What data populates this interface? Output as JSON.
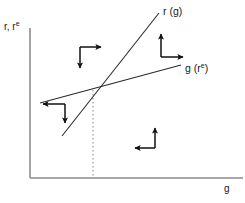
{
  "figure": {
    "type": "phase-diagram",
    "width": 245,
    "height": 203,
    "background": "#ffffff",
    "axis_color": "#8c8c8c",
    "curve_color": "#2b2b2b",
    "arrow_color": "#111111",
    "dotted_color": "#9a9a9a"
  },
  "axes": {
    "y_label": "r, r",
    "y_label_sup": "e",
    "x_label": "g",
    "origin": {
      "x": 30,
      "y": 178
    },
    "y_top": {
      "x": 30,
      "y": 28
    },
    "x_right": {
      "x": 243,
      "y": 178
    }
  },
  "curves": [
    {
      "name": "r-of-g-line",
      "label": "r (g)",
      "label_sup": "",
      "description": "steep upward sloping line",
      "start": {
        "x": 62,
        "y": 136
      },
      "end": {
        "x": 159,
        "y": 13
      },
      "label_pos": {
        "x": 163,
        "y": 6
      }
    },
    {
      "name": "g-of-re-line",
      "label": "g (r",
      "label_sup": "e",
      "label_tail": ")",
      "description": "shallow upward sloping line",
      "start": {
        "x": 40,
        "y": 103
      },
      "end": {
        "x": 181,
        "y": 65
      },
      "label_pos": {
        "x": 185,
        "y": 63
      }
    }
  ],
  "equilibrium": {
    "name": "intersection-point",
    "x": 93,
    "y": 90,
    "dotted_line_to": {
      "x": 93,
      "y": 178
    }
  },
  "arrow_clusters": [
    {
      "name": "arrow-cluster-upper-left",
      "corner": {
        "x": 80,
        "y": 47
      },
      "directions": [
        "right",
        "down"
      ],
      "right_to": {
        "x": 103,
        "y": 47
      },
      "down_to": {
        "x": 80,
        "y": 70
      }
    },
    {
      "name": "arrow-cluster-upper-right",
      "corner": {
        "x": 161,
        "y": 57
      },
      "directions": [
        "up",
        "right"
      ],
      "up_to": {
        "x": 161,
        "y": 32
      },
      "right_to": {
        "x": 185,
        "y": 57
      }
    },
    {
      "name": "arrow-cluster-left",
      "corner": {
        "x": 65,
        "y": 104
      },
      "directions": [
        "left",
        "down"
      ],
      "left_to": {
        "x": 41,
        "y": 104
      },
      "down_to": {
        "x": 65,
        "y": 125
      }
    },
    {
      "name": "arrow-cluster-lower-right",
      "corner": {
        "x": 155,
        "y": 148
      },
      "directions": [
        "up",
        "left"
      ],
      "up_to": {
        "x": 155,
        "y": 126
      },
      "left_to": {
        "x": 133,
        "y": 148
      }
    }
  ]
}
